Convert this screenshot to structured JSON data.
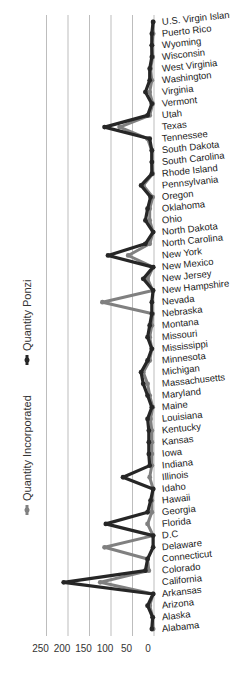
{
  "chart_data": {
    "type": "line",
    "orientation": "rotated-90",
    "title": "",
    "xlabel": "",
    "ylabel": "",
    "ylim": [
      0,
      250
    ],
    "yticks": [
      0,
      50,
      100,
      150,
      200,
      250
    ],
    "grid": true,
    "legend_position": "left",
    "categories": [
      "Alabama",
      "Alaska",
      "Arizona",
      "Arkansas",
      "California",
      "Colorado",
      "Connecticut",
      "Delaware",
      "D.C",
      "Florida",
      "Georgia",
      "Hawaii",
      "Idaho",
      "Illinois",
      "Indiana",
      "Iowa",
      "Kansas",
      "Kentucky",
      "Louisiana",
      "Maine",
      "Maryland",
      "Massachusetts",
      "Michigan",
      "Minnesota",
      "Mississippi",
      "Missouri",
      "Montana",
      "Nebraska",
      "Nevada",
      "New Hampshire",
      "New Jersey",
      "New Mexico",
      "New York",
      "North Carolina",
      "North Dakota",
      "Ohio",
      "Oklahoma",
      "Oregon",
      "Pennsylvania",
      "Rhode Island",
      "South Carolina",
      "South Dakota",
      "Tennessee",
      "Texas",
      "Utah",
      "Vermont",
      "Virginia",
      "Washington",
      "West Virginia",
      "Wisconsin",
      "Wyoming",
      "Puerto Rico",
      "U.S. Virgin Islands"
    ],
    "series": [
      {
        "name": "Quantity Incorporated",
        "color": "#808080",
        "values": [
          2,
          3,
          10,
          2,
          125,
          12,
          15,
          115,
          2,
          15,
          5,
          5,
          2,
          10,
          5,
          5,
          5,
          5,
          8,
          3,
          10,
          15,
          25,
          10,
          5,
          10,
          5,
          3,
          120,
          3,
          15,
          2,
          60,
          10,
          2,
          10,
          10,
          3,
          25,
          3,
          5,
          5,
          15,
          80,
          10,
          3,
          10,
          5,
          8,
          3,
          5,
          2,
          2
        ]
      },
      {
        "name": "Quantity Ponzi",
        "color": "#262626",
        "values": [
          5,
          3,
          15,
          2,
          210,
          20,
          15,
          2,
          2,
          112,
          15,
          8,
          2,
          72,
          10,
          12,
          12,
          12,
          15,
          5,
          15,
          25,
          30,
          15,
          5,
          15,
          10,
          5,
          5,
          2,
          25,
          2,
          107,
          20,
          2,
          20,
          15,
          8,
          30,
          5,
          5,
          5,
          10,
          115,
          15,
          5,
          20,
          10,
          10,
          5,
          5,
          5,
          2
        ]
      }
    ]
  },
  "legend": {
    "incorporated_label": "Quantity Incorporated",
    "ponzi_label": "Quantity Ponzi"
  },
  "axis": {
    "tick_labels": [
      "250",
      "200",
      "150",
      "100",
      "50",
      "0"
    ]
  }
}
